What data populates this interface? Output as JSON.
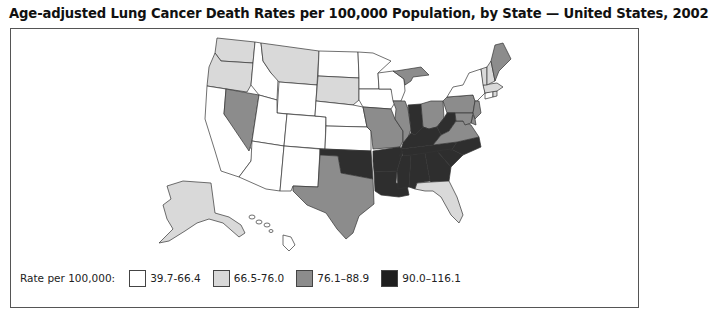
{
  "title": "Age-adjusted Lung Cancer Death Rates per 100,000 Population, by State — United States, 2002",
  "legend": {
    "label": "Rate per 100,000:",
    "items": [
      {
        "range": "39.7-66.4",
        "color": "#ffffff"
      },
      {
        "range": "66.5-76.0",
        "color": "#d9d9d9"
      },
      {
        "range": "76.1–88.9",
        "color": "#8c8c8c"
      },
      {
        "range": "90.0–116.1",
        "color": "#2e2e2e"
      }
    ]
  },
  "map_data": {
    "type": "choropleth",
    "classes": {
      "39.7-66.4": [
        "CA",
        "ID",
        "UT",
        "AZ",
        "NM",
        "CO",
        "WY",
        "ND",
        "NE",
        "KS",
        "MN",
        "IA",
        "WI",
        "NY",
        "CT",
        "HI"
      ],
      "66.5-76.0": [
        "WA",
        "OR",
        "MT",
        "SD",
        "VT",
        "NH",
        "MA",
        "RI",
        "FL",
        "AK"
      ],
      "76.1–88.9": [
        "NV",
        "TX",
        "MO",
        "IL",
        "MI",
        "OH",
        "PA",
        "NJ",
        "DE",
        "MD",
        "VA",
        "ME"
      ],
      "90.0–116.1": [
        "OK",
        "AR",
        "LA",
        "MS",
        "AL",
        "GA",
        "SC",
        "NC",
        "TN",
        "KY",
        "IN",
        "WV"
      ]
    }
  }
}
